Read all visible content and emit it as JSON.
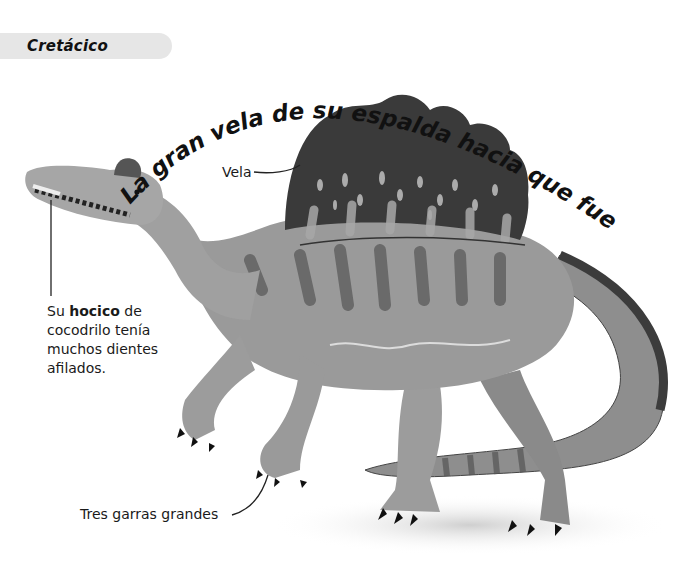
{
  "section_label": "Cretácico",
  "headline": "La gran vela de su espalda hacia que fuera más aterrador.",
  "labels": {
    "sail": "Vela",
    "snout_prefix": "Su ",
    "snout_bold": "hocico",
    "snout_suffix": " de",
    "snout_line2": "cocodrilo tenía",
    "snout_line3": "muchos dientes",
    "snout_line4": "afilados.",
    "claws": "Tres garras grandes"
  },
  "illustration": {
    "subject": "Spinosaurus",
    "colors": {
      "body": "#9a9a9a",
      "sail": "#3a3a3a",
      "stripes": "#5a5a5a",
      "claws": "#111111"
    }
  }
}
